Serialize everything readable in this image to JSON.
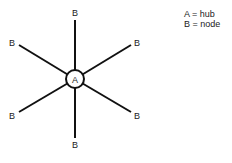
{
  "diagram": {
    "type": "star-topology",
    "hub": {
      "label": "A",
      "cx": 75,
      "cy": 79,
      "r": 9
    },
    "nodes": [
      {
        "label": "B",
        "x": 75,
        "y": 10,
        "lx": 72,
        "ly": 16,
        "ex": 75,
        "ey": 20
      },
      {
        "label": "B",
        "x": 16,
        "y": 43,
        "lx": 9,
        "ly": 46,
        "ex": 19,
        "ey": 45
      },
      {
        "label": "B",
        "x": 134,
        "y": 43,
        "lx": 134,
        "ly": 46,
        "ex": 131,
        "ey": 45
      },
      {
        "label": "B",
        "x": 16,
        "y": 115,
        "lx": 9,
        "ly": 119,
        "ex": 19,
        "ey": 112
      },
      {
        "label": "B",
        "x": 134,
        "y": 115,
        "lx": 134,
        "ly": 119,
        "ex": 131,
        "ey": 112
      },
      {
        "label": "B",
        "x": 75,
        "y": 145,
        "lx": 72,
        "ly": 148,
        "ex": 75,
        "ey": 138
      }
    ],
    "line_color": "#111111",
    "line_width": 2
  },
  "legend": {
    "items": [
      {
        "text": "A = hub"
      },
      {
        "text": "B = node"
      }
    ]
  }
}
